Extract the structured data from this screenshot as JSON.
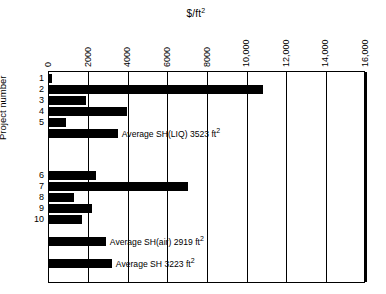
{
  "chart_data": {
    "type": "bar",
    "orientation": "horizontal",
    "title": "$/ft2",
    "title_display": "$/ft²",
    "xlabel": "$/ft²",
    "ylabel": "Project number",
    "xlim": [
      0,
      16000
    ],
    "xticks": [
      0,
      2000,
      4000,
      6000,
      8000,
      10000,
      12000,
      14000,
      16000
    ],
    "xtick_labels": [
      "0",
      "2000",
      "4000",
      "6000",
      "8000",
      "10,000",
      "12,000",
      "14,000",
      "16,000"
    ],
    "grid": true,
    "grid_axis": "x",
    "legend": "none",
    "axis_position": "top",
    "bar_color": "#000000",
    "categories": [
      "1",
      "2",
      "3",
      "4",
      "5",
      "",
      "6",
      "7",
      "8",
      "9",
      "10",
      "",
      ""
    ],
    "values": [
      200,
      10850,
      1900,
      4000,
      900,
      3523,
      2400,
      7050,
      1300,
      2200,
      1700,
      2919,
      3223
    ],
    "series": [
      {
        "name": "Cost per square foot",
        "values": [
          200,
          10850,
          1900,
          4000,
          900,
          3523,
          2400,
          7050,
          1300,
          2200,
          1700,
          2919,
          3223
        ]
      }
    ],
    "bars": [
      {
        "label": "1",
        "value": 200,
        "note": "",
        "group": "upper"
      },
      {
        "label": "2",
        "value": 10850,
        "note": "",
        "group": "upper"
      },
      {
        "label": "3",
        "value": 1900,
        "note": "",
        "group": "upper"
      },
      {
        "label": "4",
        "value": 4000,
        "note": "",
        "group": "upper"
      },
      {
        "label": "5",
        "value": 900,
        "note": "",
        "group": "upper"
      },
      {
        "label": "",
        "value": 3523,
        "note": "Average SH(LIQ) 3523 ft²",
        "group": "average"
      },
      {
        "label": "6",
        "value": 2400,
        "note": "",
        "group": "lower"
      },
      {
        "label": "7",
        "value": 7050,
        "note": "",
        "group": "lower"
      },
      {
        "label": "8",
        "value": 1300,
        "note": "",
        "group": "lower"
      },
      {
        "label": "9",
        "value": 2200,
        "note": "",
        "group": "lower"
      },
      {
        "label": "10",
        "value": 1700,
        "note": "",
        "group": "lower"
      },
      {
        "label": "",
        "value": 2919,
        "note": "Average SH(air) 2919 ft²",
        "group": "average"
      },
      {
        "label": "",
        "value": 3223,
        "note": "Average SH 3223 ft²",
        "group": "average"
      }
    ],
    "annotations": [
      "Average SH(LIQ) 3523 ft²",
      "Average SH(air) 2919 ft²",
      "Average SH 3223 ft²"
    ]
  }
}
